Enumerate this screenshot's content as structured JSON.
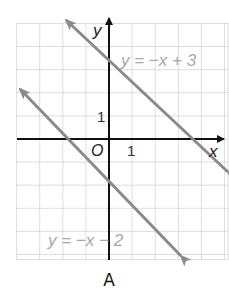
{
  "chart_data": {
    "type": "line",
    "title": "",
    "caption": "A",
    "xlabel": "x",
    "ylabel": "y",
    "origin_label": "O",
    "tick_labels": {
      "x": "1",
      "y": "1"
    },
    "xlim": [
      -4,
      5
    ],
    "ylim": [
      -5,
      5
    ],
    "grid": true,
    "series": [
      {
        "name": "y = −x + 3",
        "slope": -1,
        "intercept": 3,
        "x": [
          -2,
          5
        ],
        "y": [
          5,
          -2
        ],
        "color": "#8a8a8a"
      },
      {
        "name": "y = −x − 2",
        "slope": -1,
        "intercept": -2,
        "x": [
          -4,
          3
        ],
        "y": [
          2,
          -5
        ],
        "color": "#8a8a8a"
      }
    ],
    "legend_position": "inline labels"
  },
  "colors": {
    "grid": "#c9c9c9",
    "axis": "#111111",
    "line": "#8a8a8a",
    "label": "#a8a8a8"
  }
}
